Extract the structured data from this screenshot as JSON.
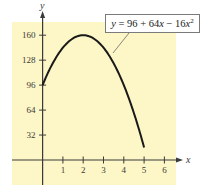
{
  "chart_data": {
    "type": "line",
    "title": "",
    "equation": "y = 96 + 64x − 16x²",
    "equation_parts": {
      "lhs": "y",
      "eq": " = 96 + 64",
      "x1": "x",
      "minus": " − 16",
      "x2": "x",
      "exp": "2"
    },
    "xlabel": "x",
    "ylabel": "y",
    "xlim": [
      0,
      6
    ],
    "ylim": [
      0,
      160
    ],
    "x_ticks": [
      1,
      2,
      3,
      4,
      5,
      6
    ],
    "y_ticks": [
      32,
      64,
      96,
      128,
      160
    ],
    "grid": false,
    "legend": "none",
    "series": [
      {
        "name": "y = 96 + 64x − 16x²",
        "x": [
          0,
          0.5,
          1,
          1.5,
          2,
          2.5,
          3,
          3.5,
          4,
          4.5,
          5
        ],
        "y": [
          96,
          124,
          144,
          156,
          160,
          156,
          144,
          124,
          96,
          60,
          16
        ]
      }
    ],
    "colors": {
      "background": "#fdf6c6",
      "curve": "#1a1a1a",
      "axis": "#3a3a3a"
    }
  },
  "labels": {
    "x_axis": "x",
    "y_axis": "y",
    "x_ticks": [
      "1",
      "2",
      "3",
      "4",
      "5",
      "6"
    ],
    "y_ticks": [
      "32",
      "64",
      "96",
      "128",
      "160"
    ]
  }
}
